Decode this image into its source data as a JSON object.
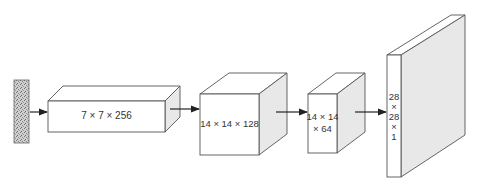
{
  "diagram": {
    "type": "generator-network-architecture",
    "colors": {
      "stroke": "#555555",
      "front_face": "#ffffff",
      "top_face": "#ffffff",
      "side_face": "#e8e8e8",
      "noise": "#9a9a9a",
      "arrow": "#222222"
    },
    "input": {
      "name": "noise-vector",
      "label": ""
    },
    "layers": [
      {
        "label": "7 × 7 × 256"
      },
      {
        "label": "14 × 14 × 128"
      },
      {
        "label_line1": "14 × 14",
        "label_line2": "× 64"
      },
      {
        "label_lines": [
          "28",
          "×",
          "28",
          "×",
          "1"
        ]
      }
    ],
    "edges": [
      {
        "from": "noise-vector",
        "to": "layer-1"
      },
      {
        "from": "layer-1",
        "to": "layer-2"
      },
      {
        "from": "layer-2",
        "to": "layer-3"
      },
      {
        "from": "layer-3",
        "to": "layer-4"
      }
    ]
  }
}
